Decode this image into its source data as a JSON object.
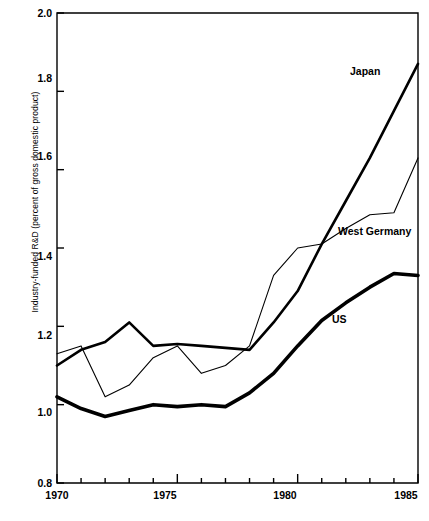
{
  "chart_data": {
    "type": "line",
    "title": "",
    "xlabel": "",
    "ylabel": "Industry-funded R&D (percent of gross domestic product)",
    "xlim": [
      1970,
      1985
    ],
    "ylim": [
      0.8,
      2.0
    ],
    "ytick_labels": [
      "2.0",
      "1.8",
      "1.6",
      "1.4",
      "1.2",
      "1.0",
      "0.8"
    ],
    "ytick_values": [
      2.0,
      1.8,
      1.6,
      1.4,
      1.2,
      1.0,
      0.8
    ],
    "xtick_labels": [
      "1970",
      "1975",
      "1980",
      "1985"
    ],
    "xtick_values": [
      1970,
      1975,
      1980,
      1985
    ],
    "minor_xticks_every": 1,
    "grid": false,
    "legend_position": "inline-annotations",
    "x": [
      1970,
      1971,
      1972,
      1973,
      1974,
      1975,
      1976,
      1977,
      1978,
      1979,
      1980,
      1981,
      1982,
      1983,
      1984,
      1985
    ],
    "series": [
      {
        "name": "Japan",
        "style": "thick",
        "label_x": 1985,
        "values": [
          1.1,
          1.14,
          1.16,
          1.21,
          1.15,
          1.155,
          1.15,
          1.145,
          1.14,
          1.21,
          1.29,
          1.41,
          1.52,
          1.63,
          1.75,
          1.87
        ]
      },
      {
        "name": "West Germany",
        "style": "thin",
        "label_x": 1983,
        "values": [
          1.13,
          1.15,
          1.02,
          1.05,
          1.12,
          1.15,
          1.08,
          1.1,
          1.15,
          1.33,
          1.4,
          1.41,
          1.45,
          1.485,
          1.49,
          1.63
        ]
      },
      {
        "name": "US",
        "style": "extra-thick",
        "label_x": 1981,
        "values": [
          1.02,
          0.99,
          0.97,
          0.985,
          1.0,
          0.995,
          1.0,
          0.995,
          1.03,
          1.08,
          1.15,
          1.215,
          1.26,
          1.3,
          1.335,
          1.33
        ]
      }
    ],
    "annotations": [
      {
        "text": "Japan",
        "x": 350,
        "y": 65
      },
      {
        "text": "West Germany",
        "x": 338,
        "y": 225
      },
      {
        "text": "US",
        "x": 332,
        "y": 313
      }
    ],
    "axis_color": "#000000"
  }
}
